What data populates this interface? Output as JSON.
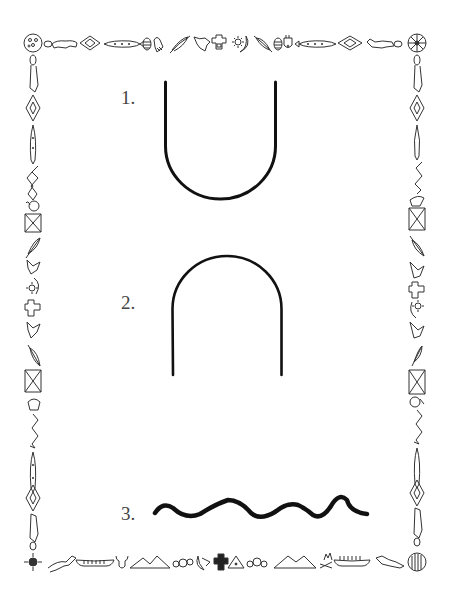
{
  "worksheet": {
    "items": [
      {
        "number": "1.",
        "shape": "u-curve"
      },
      {
        "number": "2.",
        "shape": "arch-curve"
      },
      {
        "number": "3.",
        "shape": "wavy-line"
      }
    ]
  },
  "border": {
    "style": "native-american-pictograph-frame",
    "top_icons": [
      "wheel-icon",
      "bear-icon",
      "diamond-icon",
      "fish-icon",
      "egg-icon",
      "shield-icon",
      "feather-icon",
      "bird-icon",
      "thunderbird-icon",
      "sun-moon-icon",
      "feather-icon",
      "egg-icon",
      "shield-icon",
      "fish-icon",
      "diamond-icon",
      "bear-icon",
      "medicine-wheel-icon"
    ],
    "bottom_icons": [
      "sun-symbol-icon",
      "horse-icon",
      "canoe-icon",
      "buffalo-head-icon",
      "mountains-icon",
      "stones-icon",
      "moon-icon",
      "thunderbird-icon",
      "tipi-icon",
      "stones-icon",
      "mountains-icon",
      "campfire-icon",
      "canoe-icon",
      "horse-icon",
      "drum-icon"
    ],
    "side_icons": [
      "lizard-icon",
      "diamond-icon",
      "fish-icon",
      "snake-icon",
      "shield-icon",
      "butterfly-icon",
      "feather-icon",
      "bird-icon",
      "sun-moon-icon",
      "thunderbird-icon"
    ],
    "color": "#333333"
  },
  "colors": {
    "stroke": "#111111",
    "label": "#444444",
    "background": "#ffffff"
  }
}
